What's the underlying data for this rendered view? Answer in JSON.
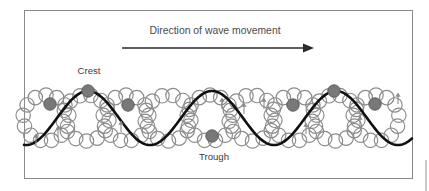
{
  "figure": {
    "name": "wave-motion-diagram",
    "title": "Direction of wave movement",
    "background_color": "#ffffff",
    "frame": {
      "x": 24,
      "y": 10,
      "width": 388,
      "height": 168,
      "stroke": "#8a8a8a",
      "stroke_width": 1
    },
    "edge_artifact": {
      "x": 425,
      "y": 160,
      "width": 2,
      "height": 31,
      "color": "#c8c8c8"
    }
  },
  "labels": {
    "title": "Direction of wave movement",
    "crest": "Crest",
    "trough": "Trough",
    "title_x": 215,
    "title_y": 34,
    "crest_x": 89,
    "crest_y": 74,
    "trough_x": 214,
    "trough_y": 160
  },
  "arrow": {
    "name": "direction-arrow",
    "x1": 122,
    "y1": 48,
    "x2": 303,
    "y2": 48,
    "head_length": 11,
    "head_width": 9,
    "color": "#2b2b2b",
    "stroke_width": 1.4
  },
  "chart_data": {
    "type": "line",
    "title": "Direction of wave movement",
    "xlabel": "",
    "ylabel": "",
    "annotations": [
      "Crest",
      "Trough"
    ],
    "wave": {
      "description": "Transverse sine wave representing ocean surface",
      "baseline_y": 118,
      "amplitude": 27,
      "wavelength": 124,
      "phase_x": 88,
      "x_start": 24,
      "x_end": 412,
      "stroke": "#111111",
      "stroke_width": 2.6,
      "crest_x": [
        88,
        336
      ],
      "crest_y": 91,
      "trough_x": [
        212
      ],
      "trough_y": 145,
      "periods": 2.0
    },
    "orbits": {
      "description": "Circular orbital paths of water particles, each drawn as a ring of small open circles",
      "ring_centers_x": [
        46,
        86,
        126,
        168,
        210,
        252,
        294,
        335,
        376
      ],
      "ring_center_y": 118,
      "ring_radius": 23,
      "particle_radius": 7.2,
      "particles_per_ring": 13,
      "stroke": "#8c8c8c",
      "stroke_width": 1.2,
      "fill": "#ffffff"
    },
    "markers": {
      "description": "Filled dark particles showing instantaneous surface positions along the wave",
      "radius": 6.2,
      "color": "#787878",
      "stroke": "#5e5e5e",
      "points": [
        {
          "x": 50,
          "y": 104
        },
        {
          "x": 88,
          "y": 91
        },
        {
          "x": 128,
          "y": 105
        },
        {
          "x": 212,
          "y": 136
        },
        {
          "x": 293,
          "y": 105
        },
        {
          "x": 334,
          "y": 91
        },
        {
          "x": 375,
          "y": 104
        }
      ]
    },
    "arrow_indicators": {
      "description": "Small arrows on orbit rings showing particle rotation sense",
      "color": "#8c8c8c",
      "points": [
        {
          "x": 58,
          "y": 132,
          "dir": "up"
        },
        {
          "x": 36,
          "y": 140,
          "dir": "up"
        },
        {
          "x": 121,
          "y": 127,
          "dir": "up"
        },
        {
          "x": 222,
          "y": 104,
          "dir": "up"
        },
        {
          "x": 244,
          "y": 109,
          "dir": "up"
        },
        {
          "x": 264,
          "y": 104,
          "dir": "up"
        },
        {
          "x": 306,
          "y": 129,
          "dir": "up"
        },
        {
          "x": 360,
          "y": 122,
          "dir": "up"
        },
        {
          "x": 398,
          "y": 99,
          "dir": "up"
        }
      ]
    }
  }
}
